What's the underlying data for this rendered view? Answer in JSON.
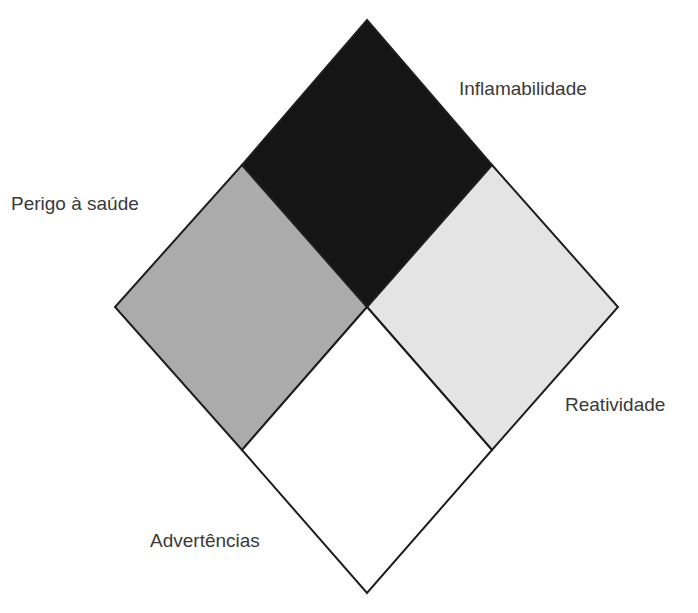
{
  "diagram": {
    "type": "hazard-diamond",
    "labels": {
      "top": "Inflamabilidade",
      "left": "Perigo à saúde",
      "right": "Reatividade",
      "bottom": "Advertências"
    },
    "colors": {
      "top": "#151515",
      "left": "#ababab",
      "right": "#e4e4e4",
      "bottom": "#ffffff",
      "stroke": "#1e1e1e",
      "text": "#3a3a3a"
    }
  }
}
